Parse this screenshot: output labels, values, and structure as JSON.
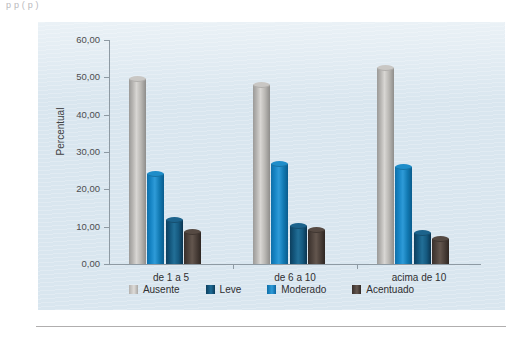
{
  "top_caption": "p    p     (  p       )",
  "chart_data": {
    "type": "bar",
    "title": "",
    "subtitle": "",
    "xlabel": "",
    "ylabel": "Percentual",
    "categories": [
      "de 1 a 5",
      "de 6 a 10",
      "acima de 10"
    ],
    "series": [
      {
        "name": "Ausente",
        "color": "#c9c7c4",
        "values": [
          50.3,
          48.7,
          53.3
        ]
      },
      {
        "name": "Leve",
        "color": "#1c638c",
        "values": [
          12.6,
          11.0,
          9.0
        ]
      },
      {
        "name": "Moderado",
        "color": "#1e8dc9",
        "values": [
          24.9,
          27.7,
          26.9
        ]
      },
      {
        "name": "Acentuado",
        "color": "#564a43",
        "values": [
          9.4,
          9.8,
          7.5
        ]
      }
    ],
    "bar_order": [
      "Ausente",
      "Moderado",
      "Leve",
      "Acentuado"
    ],
    "ylim": [
      0,
      60
    ],
    "yticks": [
      "0,00",
      "10,00",
      "20,00",
      "30,00",
      "40,00",
      "50,00",
      "60,00"
    ],
    "ytick_values": [
      0,
      10,
      20,
      30,
      40,
      50,
      60
    ],
    "grid": false,
    "legend_position": "bottom",
    "plot_background": "#d9e6ef"
  },
  "legend": {
    "items": [
      {
        "label": "Ausente"
      },
      {
        "label": "Leve"
      },
      {
        "label": "Moderado"
      },
      {
        "label": "Acentuado"
      }
    ]
  }
}
